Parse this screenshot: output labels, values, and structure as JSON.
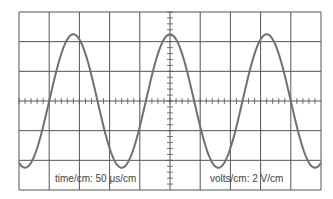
{
  "scope": {
    "time_per_div_label": "time/cm:  50 μs/cm",
    "volts_per_div_label": "volts/cm:  2 V/cm",
    "divisions_x": 10,
    "divisions_y": 6,
    "grid_color": "#555555",
    "trace_color": "#707070"
  },
  "chart_data": {
    "type": "line",
    "xlabel": "time/cm: 50 μs/cm",
    "ylabel": "volts/cm: 2 V/cm",
    "divisions": {
      "x": 10,
      "y": 6
    },
    "waveform": "sine",
    "period_div": 3.2,
    "amplitude_div": 2.25,
    "period_us": 160,
    "amplitude_V": 4.5,
    "peak_positions_div": [
      1.8,
      5.0,
      8.2
    ],
    "trough_positions_div": [
      0.2,
      3.4,
      6.6,
      9.8
    ]
  }
}
